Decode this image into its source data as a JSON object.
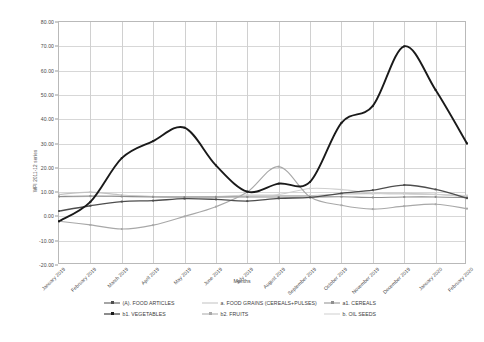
{
  "chart": {
    "type": "line",
    "title": "",
    "xlabel": "Months",
    "ylabel": "WPI 2011-12 series",
    "grid": true,
    "legend_position": "bottom"
  },
  "axes": {
    "y_ticks": [
      "80.00",
      "70.00",
      "60.00",
      "50.00",
      "40.00",
      "30.00",
      "20.00",
      "10.00",
      "0.00",
      "-10.00",
      "-20.00"
    ],
    "y_min": -20,
    "y_max": 80,
    "y_step": 10,
    "x_ticks": [
      "January 2019",
      "February 2019",
      "March 2019",
      "April 2019",
      "May 2019",
      "June 2019",
      "July 2019",
      "August 2019",
      "September 2019",
      "October 2019",
      "November 2019",
      "December 2019",
      "January 2020",
      "February 2020"
    ]
  },
  "legend": {
    "items": [
      {
        "label": "(A).  FOOD ARTICLES",
        "color": "#4d4d4d",
        "marker": "plus"
      },
      {
        "label": "a.  FOOD GRAINS (CEREALS+PULSES)",
        "color": "#c2c2c2",
        "marker": "dash"
      },
      {
        "label": "a1.  CEREALS",
        "color": "#8e8e8e",
        "marker": "plus"
      },
      {
        "label": "b1. VEGETABLES",
        "color": "#1a1a1a",
        "marker": "plus"
      },
      {
        "label": "b2. FRUITS",
        "color": "#a8a8a8",
        "marker": "plus"
      },
      {
        "label": "b.  OIL SEEDS",
        "color": "#cfcfcf",
        "marker": "dash"
      }
    ]
  },
  "chart_data": {
    "type": "line",
    "title": "",
    "xlabel": "Months",
    "ylabel": "WPI 2011-12 series",
    "ylim": [
      -20,
      80
    ],
    "grid": true,
    "legend_position": "bottom",
    "categories": [
      "January 2019",
      "February 2019",
      "March 2019",
      "April 2019",
      "May 2019",
      "June 2019",
      "July 2019",
      "August 2019",
      "September 2019",
      "October 2019",
      "November 2019",
      "December 2019",
      "January 2020",
      "February 2020"
    ],
    "series": [
      {
        "name": "(A).  FOOD ARTICLES",
        "color": "#4d4d4d",
        "values": [
          2.2,
          4.4,
          6.1,
          6.5,
          7.3,
          7.0,
          6.3,
          7.4,
          7.8,
          9.5,
          10.8,
          12.9,
          11.1,
          7.5
        ]
      },
      {
        "name": "a.  FOOD GRAINS (CEREALS+PULSES)",
        "color": "#c2c2c2",
        "values": [
          9.0,
          10.0,
          8.8,
          8.2,
          8.0,
          8.0,
          8.4,
          8.6,
          8.6,
          9.2,
          9.4,
          9.5,
          9.1,
          8.0
        ]
      },
      {
        "name": "a1.  CEREALS",
        "color": "#8e8e8e",
        "values": [
          8.2,
          8.4,
          8.2,
          8.0,
          8.0,
          8.0,
          8.0,
          8.0,
          8.0,
          8.1,
          7.8,
          8.0,
          8.0,
          7.7
        ]
      },
      {
        "name": "b1. VEGETABLES",
        "color": "#1a1a1a",
        "values": [
          -2.0,
          6.0,
          24.0,
          31.0,
          36.5,
          21.0,
          10.2,
          13.5,
          14.2,
          38.5,
          45.5,
          70.0,
          52.0,
          30.0
        ]
      },
      {
        "name": "b2. FRUITS",
        "color": "#a8a8a8",
        "values": [
          -2.0,
          -3.5,
          -5.2,
          -3.6,
          0.0,
          4.0,
          10.0,
          20.5,
          8.0,
          4.6,
          3.0,
          4.2,
          5.0,
          3.2
        ]
      },
      {
        "name": "b.  OIL SEEDS",
        "color": "#cfcfcf",
        "values": [
          8.0,
          8.2,
          8.5,
          8.2,
          8.0,
          8.2,
          8.8,
          9.0,
          11.5,
          11.0,
          9.6,
          9.2,
          9.0,
          8.6
        ]
      }
    ]
  }
}
